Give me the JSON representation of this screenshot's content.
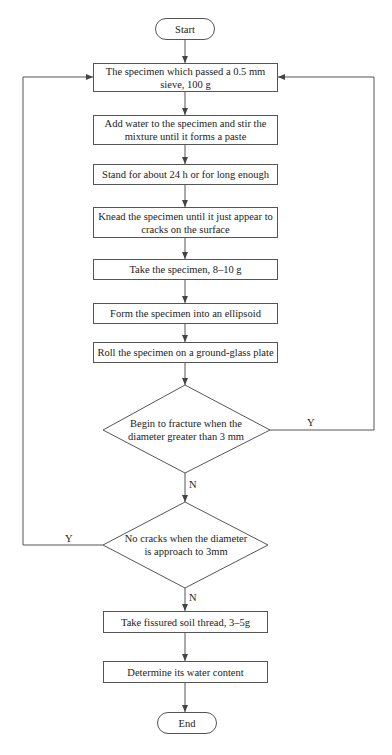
{
  "diagram": {
    "type": "flowchart",
    "nodes": {
      "start": "Start",
      "step1_line1": "The specimen which passed a 0.5 mm",
      "step1_line2": "sieve, 100 g",
      "step2_line1": "Add water to the specimen and stir the",
      "step2_line2": "mixture until it forms a paste",
      "step3": "Stand for about 24 h or for long enough",
      "step4_line1": "Knead the specimen until it just appear to",
      "step4_line2": "cracks on the surface",
      "step5": "Take the specimen, 8–10 g",
      "step6": "Form the specimen into an ellipsoid",
      "step7": "Roll the specimen on a ground-glass plate",
      "decision1_line1": "Begin to fracture when the",
      "decision1_line2": "diameter greater than 3 mm",
      "decision2_line1": "No cracks when the diameter",
      "decision2_line2": "is approach to 3mm",
      "step8": "Take fissured soil thread, 3–5g",
      "step9": "Determine its water content",
      "end": "End"
    },
    "labels": {
      "decision1_yes": "Y",
      "decision1_no": "N",
      "decision2_yes": "Y",
      "decision2_no": "N"
    },
    "edges": [
      {
        "from": "start",
        "to": "step1"
      },
      {
        "from": "step1",
        "to": "step2"
      },
      {
        "from": "step2",
        "to": "step3"
      },
      {
        "from": "step3",
        "to": "step4"
      },
      {
        "from": "step4",
        "to": "step5"
      },
      {
        "from": "step5",
        "to": "step6"
      },
      {
        "from": "step6",
        "to": "step7"
      },
      {
        "from": "step7",
        "to": "decision1"
      },
      {
        "from": "decision1",
        "to": "step1",
        "label": "Y"
      },
      {
        "from": "decision1",
        "to": "decision2",
        "label": "N"
      },
      {
        "from": "decision2",
        "to": "step1",
        "label": "Y"
      },
      {
        "from": "decision2",
        "to": "step8",
        "label": "N"
      },
      {
        "from": "step8",
        "to": "step9"
      },
      {
        "from": "step9",
        "to": "end"
      }
    ],
    "colors": {
      "line": "#555555",
      "text": "#222222",
      "background": "#ffffff"
    }
  }
}
